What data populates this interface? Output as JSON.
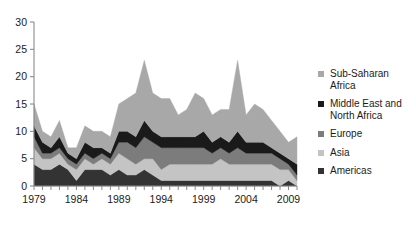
{
  "chart_data": {
    "type": "area",
    "stacked": true,
    "title": "",
    "subtitle": "",
    "xlabel": "",
    "ylabel": "",
    "xlim": [
      1979,
      2010
    ],
    "ylim": [
      0,
      30
    ],
    "yticks": [
      0,
      5,
      10,
      15,
      20,
      25,
      30
    ],
    "xticks": [
      1979,
      1984,
      1989,
      1994,
      1999,
      2004,
      2009
    ],
    "xtick_labels": [
      "1979",
      "1984",
      "1989",
      "1994",
      "1999",
      "2004",
      "2009"
    ],
    "ytick_labels": [
      "0",
      "5",
      "10",
      "15",
      "20",
      "25",
      "30"
    ],
    "minor_xticks_every": 1,
    "grid": false,
    "legend_position": "right",
    "x": [
      1979,
      1980,
      1981,
      1982,
      1983,
      1984,
      1985,
      1986,
      1987,
      1988,
      1989,
      1990,
      1991,
      1992,
      1993,
      1994,
      1995,
      1996,
      1997,
      1998,
      1999,
      2000,
      2001,
      2002,
      2003,
      2004,
      2005,
      2006,
      2007,
      2008,
      2009,
      2010
    ],
    "series": [
      {
        "name": "Americas",
        "color": "#333333",
        "values": [
          4,
          3,
          3,
          4,
          3,
          1,
          3,
          3,
          3,
          2,
          3,
          2,
          2,
          3,
          2,
          1,
          1,
          1,
          1,
          1,
          1,
          1,
          1,
          1,
          1,
          1,
          1,
          1,
          1,
          0,
          1,
          0
        ]
      },
      {
        "name": "Asia",
        "color": "#c4c4c4",
        "values": [
          3,
          2,
          2,
          2,
          1,
          2,
          2,
          1,
          2,
          2,
          3,
          3,
          2,
          2,
          3,
          2,
          3,
          3,
          3,
          3,
          3,
          3,
          4,
          3,
          3,
          3,
          3,
          3,
          3,
          3,
          2,
          1
        ]
      },
      {
        "name": "Europe",
        "color": "#7c7c7c",
        "values": [
          2,
          1,
          1,
          1,
          1,
          1,
          1,
          1,
          1,
          1,
          2,
          3,
          3,
          4,
          3,
          4,
          3,
          3,
          3,
          3,
          3,
          2,
          2,
          2,
          3,
          2,
          2,
          2,
          2,
          2,
          1,
          1
        ]
      },
      {
        "name": "Middle East and North Africa",
        "color": "#1a1a1a",
        "values": [
          2,
          2,
          1,
          2,
          1,
          1,
          2,
          2,
          1,
          1,
          2,
          2,
          2,
          3,
          2,
          2,
          2,
          2,
          2,
          2,
          3,
          2,
          2,
          2,
          3,
          2,
          2,
          2,
          1,
          1,
          1,
          2
        ]
      },
      {
        "name": "Sub-Saharan Africa",
        "color": "#a8a8a8",
        "values": [
          4,
          2,
          2,
          3,
          1,
          2,
          3,
          3,
          3,
          3,
          5,
          6,
          8,
          11,
          7,
          7,
          7,
          4,
          5,
          8,
          6,
          5,
          5,
          6,
          13,
          5,
          7,
          6,
          5,
          4,
          3,
          5
        ]
      }
    ],
    "legend_entries": [
      {
        "label": "Sub-Saharan\nAfrica",
        "color": "#a8a8a8"
      },
      {
        "label": "Middle East and\nNorth Africa",
        "color": "#1a1a1a"
      },
      {
        "label": "Europe",
        "color": "#7c7c7c"
      },
      {
        "label": "Asia",
        "color": "#c4c4c4"
      },
      {
        "label": "Americas",
        "color": "#333333"
      }
    ]
  }
}
